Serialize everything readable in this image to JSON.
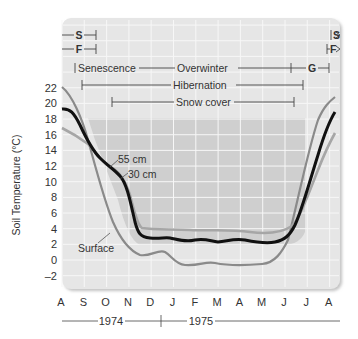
{
  "chart_data": {
    "type": "line",
    "title": "",
    "ylabel": "Soil Temperature (°C)",
    "xlabel": "",
    "ylim": [
      -2,
      22
    ],
    "yticks": [
      22,
      20,
      18,
      16,
      14,
      12,
      10,
      8,
      6,
      4,
      2,
      0,
      -2
    ],
    "ytick_labels": [
      "22",
      "20",
      "18",
      "16",
      "14",
      "12",
      "10",
      "8",
      "6",
      "4",
      "2",
      "0",
      "–2"
    ],
    "categories": [
      "A",
      "S",
      "O",
      "N",
      "D",
      "J",
      "F",
      "M",
      "A",
      "M",
      "J",
      "J",
      "A"
    ],
    "year_labels": [
      "1974",
      "1975"
    ],
    "grid": true,
    "series": [
      {
        "name": "Surface",
        "color": "#8a8a8a",
        "values": [
          22.2,
          16.0,
          6.5,
          1.5,
          0.5,
          -0.8,
          -0.5,
          -0.8,
          -0.8,
          -0.5,
          6.0,
          17.5,
          21.5
        ]
      },
      {
        "name": "30 cm",
        "color": "#111111",
        "values": [
          19.3,
          14.0,
          10.5,
          3.0,
          2.5,
          2.5,
          2.3,
          2.5,
          2.2,
          2.0,
          4.0,
          11.0,
          19.0
        ]
      },
      {
        "name": "55 cm",
        "color": "#a6a6a6",
        "values": [
          16.8,
          14.0,
          11.5,
          4.0,
          3.6,
          3.5,
          3.5,
          3.5,
          3.5,
          3.0,
          4.5,
          10.0,
          16.0
        ]
      }
    ],
    "annotations": {
      "series_labels": [
        "55 cm",
        "30 cm",
        "Surface"
      ],
      "phases": [
        {
          "label": "S",
          "row": 1,
          "from": "A",
          "to": "mid-S"
        },
        {
          "label": "F",
          "row": 2,
          "from": "A",
          "to": "mid-S"
        },
        {
          "label": "Senescence",
          "row": 3,
          "from": "late-A",
          "to": "S"
        },
        {
          "label": "Overwinter",
          "row": 3,
          "from": "S",
          "to": "mid-J"
        },
        {
          "label": "G",
          "row": 3,
          "from": "mid-J",
          "to": "A"
        },
        {
          "label": "Hibernation",
          "row": 4,
          "from": "early-S",
          "to": "late-J"
        },
        {
          "label": "Snow cover",
          "row": 5,
          "from": "mid-O",
          "to": "mid-J"
        },
        {
          "label": "S",
          "row": 1,
          "from": "A",
          "to": "→"
        },
        {
          "label": "F",
          "row": 2,
          "from": "late-J",
          "to": "→"
        }
      ]
    }
  },
  "labels": {
    "y_axis": "Soil Temperature (°C)",
    "series_55": "55 cm",
    "series_30": "30 cm",
    "series_surface": "Surface",
    "phase_s": "S",
    "phase_f": "F",
    "phase_senescence": "Senescence",
    "phase_overwinter": "Overwinter",
    "phase_g": "G",
    "phase_hibernation": "Hibernation",
    "phase_snow": "Snow cover",
    "year_1974": "1974",
    "year_1975": "1975"
  }
}
